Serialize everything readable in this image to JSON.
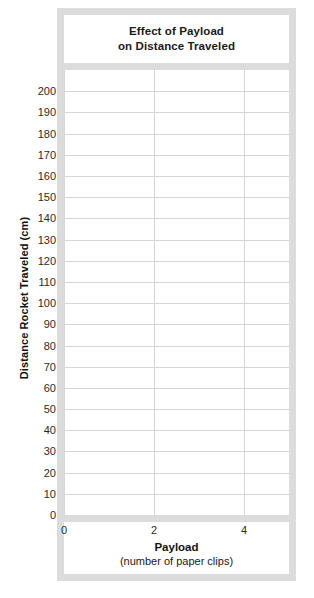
{
  "chart_data": {
    "type": "line",
    "title": "Effect of Payload on Distance Traveled",
    "title_lines": [
      "Effect of Payload",
      "on Distance Traveled"
    ],
    "xlabel": "Payload",
    "xlabel_sub": "(number of paper clips)",
    "ylabel": "Distance Rocket Traveled (cm)",
    "xlim": [
      0,
      5
    ],
    "ylim": [
      0,
      210
    ],
    "x_ticks": [
      0,
      2,
      4
    ],
    "x_tick_labels": [
      "0",
      "2",
      "4"
    ],
    "y_ticks": [
      0,
      10,
      20,
      30,
      40,
      50,
      60,
      70,
      80,
      90,
      100,
      110,
      120,
      130,
      140,
      150,
      160,
      170,
      180,
      190,
      200
    ],
    "y_tick_labels": [
      "200",
      "190",
      "180",
      "170",
      "160",
      "150",
      "140",
      "130",
      "120",
      "110",
      "100",
      "90",
      "80",
      "70",
      "60",
      "50",
      "40",
      "30",
      "20",
      "10",
      "0"
    ],
    "grid": true,
    "legend": false,
    "series": [],
    "values": [],
    "categories": []
  },
  "colors": {
    "frame": "#dcdcdc",
    "grid": "#d3d7db",
    "text": "#1a1a1a",
    "background": "#ffffff"
  }
}
